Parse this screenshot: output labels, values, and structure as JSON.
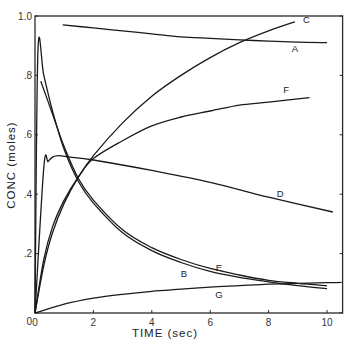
{
  "chart_data": {
    "type": "line",
    "title": "",
    "xlabel": "TIME (sec)",
    "ylabel": "CONC (moles)",
    "xlim": [
      0,
      10.5
    ],
    "ylim": [
      0,
      1.0
    ],
    "grid": false,
    "legend": "inline curve labels",
    "x_ticks": [
      0,
      2,
      4,
      6,
      8,
      10
    ],
    "x_tick_labels": [
      "0",
      "2",
      "4",
      "6",
      "8",
      "10"
    ],
    "y_ticks": [
      0,
      0.2,
      0.4,
      0.6,
      0.8,
      1.0
    ],
    "y_tick_labels": [
      "0",
      ".2",
      ".4",
      ".6",
      ".8",
      "1.0"
    ],
    "series": [
      {
        "name": "A",
        "label_pos": [
          8.9,
          0.88
        ],
        "x": [
          0.95,
          2,
          3,
          4,
          5,
          6,
          7,
          8,
          9,
          10
        ],
        "y": [
          0.97,
          0.96,
          0.95,
          0.94,
          0.93,
          0.925,
          0.92,
          0.915,
          0.912,
          0.91
        ]
      },
      {
        "name": "B",
        "label_pos": [
          5.1,
          0.12
        ],
        "x": [
          0,
          0.1,
          0.3,
          0.6,
          1.0,
          1.5,
          2,
          3,
          4,
          5,
          6,
          7,
          8,
          9,
          10
        ],
        "y": [
          0,
          0.88,
          0.8,
          0.68,
          0.55,
          0.44,
          0.37,
          0.27,
          0.21,
          0.17,
          0.14,
          0.12,
          0.105,
          0.092,
          0.082
        ]
      },
      {
        "name": "C",
        "label_pos": [
          9.3,
          0.975
        ],
        "x": [
          0,
          0.3,
          0.6,
          1,
          1.5,
          2,
          3,
          4,
          5,
          6,
          7,
          8,
          8.9
        ],
        "y": [
          0,
          0.16,
          0.27,
          0.37,
          0.46,
          0.53,
          0.64,
          0.73,
          0.8,
          0.86,
          0.91,
          0.95,
          0.98
        ]
      },
      {
        "name": "D",
        "label_pos": [
          8.4,
          0.39
        ],
        "x": [
          0,
          0.3,
          0.45,
          0.6,
          0.8,
          1.2,
          2,
          4,
          6,
          8,
          10.2
        ],
        "y": [
          0,
          0.49,
          0.51,
          0.525,
          0.53,
          0.525,
          0.515,
          0.48,
          0.44,
          0.39,
          0.34
        ]
      },
      {
        "name": "E",
        "label_pos": [
          6.3,
          0.14
        ],
        "x": [
          0.2,
          0.6,
          1.0,
          1.5,
          2,
          3,
          4,
          5,
          6,
          7,
          8,
          9,
          10
        ],
        "y": [
          0.78,
          0.67,
          0.56,
          0.45,
          0.38,
          0.28,
          0.22,
          0.18,
          0.15,
          0.128,
          0.11,
          0.1,
          0.092
        ]
      },
      {
        "name": "F",
        "label_pos": [
          8.6,
          0.74
        ],
        "x": [
          0,
          0.3,
          0.6,
          1,
          1.5,
          2,
          3,
          4,
          5,
          6,
          7,
          8,
          9.4
        ],
        "y": [
          0,
          0.18,
          0.29,
          0.38,
          0.46,
          0.52,
          0.58,
          0.63,
          0.66,
          0.68,
          0.7,
          0.71,
          0.725
        ]
      },
      {
        "name": "G",
        "label_pos": [
          6.3,
          0.05
        ],
        "x": [
          0,
          1,
          2,
          3,
          4,
          5,
          6,
          7,
          8,
          9,
          10,
          10.5
        ],
        "y": [
          0,
          0.03,
          0.05,
          0.063,
          0.073,
          0.08,
          0.087,
          0.092,
          0.097,
          0.1,
          0.102,
          0.103
        ]
      }
    ]
  }
}
